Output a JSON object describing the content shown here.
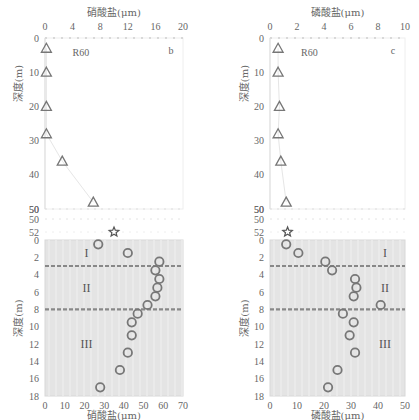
{
  "chart_data": [
    {
      "panel_label": "b",
      "site_label": "R60",
      "type": "scatter",
      "ylabel": "深度(m)",
      "upper": {
        "xlabel": "硝酸盐(μm)",
        "xlim": [
          0,
          20
        ],
        "xticks": [
          0,
          4,
          8,
          12,
          16,
          20
        ],
        "yticks": [
          0,
          10,
          20,
          30,
          40,
          50
        ],
        "marker": "triangle",
        "points": [
          {
            "x": 0.2,
            "y": 3
          },
          {
            "x": 0.2,
            "y": 10
          },
          {
            "x": 0.2,
            "y": 20
          },
          {
            "x": 0.2,
            "y": 28
          },
          {
            "x": 2.5,
            "y": 36
          },
          {
            "x": 7,
            "y": 48
          }
        ],
        "break_labels": [
          "50",
          "52"
        ],
        "star": {
          "x": 10,
          "y": 52
        }
      },
      "lower": {
        "xlabel": "硝酸盐(μm)",
        "xlim": [
          0,
          70
        ],
        "xticks": [
          0,
          10,
          20,
          30,
          40,
          50,
          60,
          70
        ],
        "ylim": [
          0,
          18
        ],
        "yticks": [
          0,
          2,
          4,
          6,
          8,
          10,
          12,
          14,
          16,
          18
        ],
        "marker": "circle",
        "points": [
          {
            "x": 27,
            "y": 0.5
          },
          {
            "x": 42,
            "y": 1.5
          },
          {
            "x": 58,
            "y": 2.5
          },
          {
            "x": 56,
            "y": 3.5
          },
          {
            "x": 58,
            "y": 4.5
          },
          {
            "x": 57,
            "y": 5.5
          },
          {
            "x": 56,
            "y": 6.5
          },
          {
            "x": 52,
            "y": 7.5
          },
          {
            "x": 47,
            "y": 8.5
          },
          {
            "x": 44,
            "y": 9.5
          },
          {
            "x": 44,
            "y": 11
          },
          {
            "x": 42,
            "y": 13
          },
          {
            "x": 38,
            "y": 15
          },
          {
            "x": 28,
            "y": 17
          }
        ],
        "dashed_lines": [
          3,
          8
        ],
        "zones": [
          {
            "label": "I",
            "y": 1.5
          },
          {
            "label": "II",
            "y": 5.5
          },
          {
            "label": "III",
            "y": 12
          }
        ]
      }
    },
    {
      "panel_label": "c",
      "site_label": "R60",
      "type": "scatter",
      "ylabel": "深度(m)",
      "upper": {
        "xlabel": "磷酸盐(μm)",
        "xlim": [
          0,
          10
        ],
        "xticks": [
          0,
          2,
          4,
          6,
          8,
          10
        ],
        "yticks": [
          0,
          10,
          20,
          30,
          40,
          50
        ],
        "marker": "triangle",
        "points": [
          {
            "x": 0.6,
            "y": 3
          },
          {
            "x": 0.6,
            "y": 10
          },
          {
            "x": 0.7,
            "y": 20
          },
          {
            "x": 0.6,
            "y": 28
          },
          {
            "x": 0.8,
            "y": 36
          },
          {
            "x": 1.2,
            "y": 48
          }
        ],
        "break_labels": [
          "50",
          "52"
        ],
        "star": {
          "x": 1.3,
          "y": 52
        }
      },
      "lower": {
        "xlabel": "磷酸盐(μm)",
        "xlim": [
          0,
          50
        ],
        "xticks": [
          0,
          10,
          20,
          30,
          40,
          50
        ],
        "ylim": [
          0,
          18
        ],
        "yticks": [
          0,
          2,
          4,
          6,
          8,
          10,
          12,
          14,
          16,
          18
        ],
        "marker": "circle",
        "points": [
          {
            "x": 6,
            "y": 0.5
          },
          {
            "x": 10.5,
            "y": 1.5
          },
          {
            "x": 20.5,
            "y": 2.5
          },
          {
            "x": 23,
            "y": 3.5
          },
          {
            "x": 31.5,
            "y": 4.5
          },
          {
            "x": 32,
            "y": 5.5
          },
          {
            "x": 31,
            "y": 6.5
          },
          {
            "x": 41,
            "y": 7.5
          },
          {
            "x": 27,
            "y": 8.5
          },
          {
            "x": 31,
            "y": 9.5
          },
          {
            "x": 29.5,
            "y": 11
          },
          {
            "x": 31.5,
            "y": 13
          },
          {
            "x": 25,
            "y": 15
          },
          {
            "x": 21.5,
            "y": 17
          }
        ],
        "dashed_lines": [
          3,
          8
        ],
        "zones": [
          {
            "label": "I",
            "y": 1.5
          },
          {
            "label": "II",
            "y": 5.5
          },
          {
            "label": "III",
            "y": 12
          }
        ]
      }
    }
  ],
  "layout": {
    "charts": [
      {
        "left": 45,
        "right": 183,
        "ylabel_x": 22
      },
      {
        "left": 270,
        "right": 405,
        "ylabel_x": 248
      }
    ],
    "upper_top": 38,
    "upper_bottom": 209,
    "upper_max": 50,
    "break_y": [
      209,
      219,
      232
    ],
    "lower_top": 240,
    "lower_bottom": 396,
    "top_axis_label_y": 16,
    "top_tick_y": 30,
    "bottom_tick_y": 409,
    "bottom_label_y": 420
  },
  "colors": {
    "marker": "#777777",
    "shade": "#e4e4e4",
    "dash": "#888888",
    "frame": "#d8d8d8",
    "text": "#666666"
  }
}
